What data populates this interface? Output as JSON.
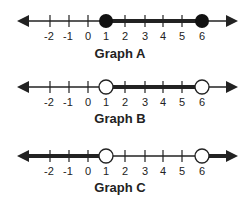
{
  "figure": {
    "graphs": [
      {
        "title": "Graph A",
        "ticks": [
          "-2",
          "-1",
          "0",
          "1",
          "2",
          "3",
          "4",
          "5",
          "6"
        ],
        "endpoints": [
          {
            "value": 1,
            "type": "closed"
          },
          {
            "value": 6,
            "type": "closed"
          }
        ],
        "shaded": [
          {
            "from": 1,
            "to": 6
          }
        ],
        "description": "Closed circles at 1 and 6, shaded between them"
      },
      {
        "title": "Graph B",
        "ticks": [
          "-2",
          "-1",
          "0",
          "1",
          "2",
          "3",
          "4",
          "5",
          "6"
        ],
        "endpoints": [
          {
            "value": 1,
            "type": "open"
          },
          {
            "value": 6,
            "type": "open"
          }
        ],
        "shaded": [
          {
            "from": 1,
            "to": 6
          }
        ],
        "description": "Open circles at 1 and 6, shaded between them"
      },
      {
        "title": "Graph C",
        "ticks": [
          "-2",
          "-1",
          "0",
          "1",
          "2",
          "3",
          "4",
          "5",
          "6"
        ],
        "endpoints": [
          {
            "value": 1,
            "type": "open"
          },
          {
            "value": 6,
            "type": "open"
          }
        ],
        "shaded": [
          {
            "from": "-infinity",
            "to": 1
          },
          {
            "from": 6,
            "to": "infinity"
          }
        ],
        "description": "Open circles at 1 and 6, shaded outward to both arrows"
      }
    ],
    "colors": {
      "line": "#222222",
      "fill_closed": "#111111",
      "fill_open": "#ffffff"
    }
  }
}
